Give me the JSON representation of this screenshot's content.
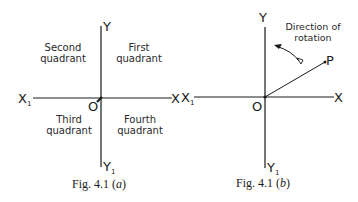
{
  "figures": [
    {
      "id": "a",
      "caption_prefix": "Fig. 4.1",
      "caption_part": "(a)",
      "caption_letter": "a",
      "axes": {
        "x_pos": "X",
        "x_neg": "X",
        "x_neg_sub": "1",
        "y_pos": "Y",
        "y_neg": "Y",
        "y_neg_sub": "1",
        "origin": "O"
      },
      "quadrants": [
        {
          "line1": "First",
          "line2": "quadrant"
        },
        {
          "line1": "Second",
          "line2": "quadrant"
        },
        {
          "line1": "Third",
          "line2": "quadrant"
        },
        {
          "line1": "Fourth",
          "line2": "quadrant"
        }
      ]
    },
    {
      "id": "b",
      "caption_prefix": "Fig. 4.1",
      "caption_letter": "b",
      "axes": {
        "x_pos": "X",
        "x_neg": "X",
        "x_neg_sub": "1",
        "y_pos": "Y",
        "y_neg": "Y",
        "y_neg_sub": "1",
        "origin": "O"
      },
      "point": "P",
      "rotation_label_line1": "Direction of",
      "rotation_label_line2": "rotation"
    }
  ],
  "colors": {
    "ink": "#1a1a1a",
    "background": "#ffffff"
  }
}
